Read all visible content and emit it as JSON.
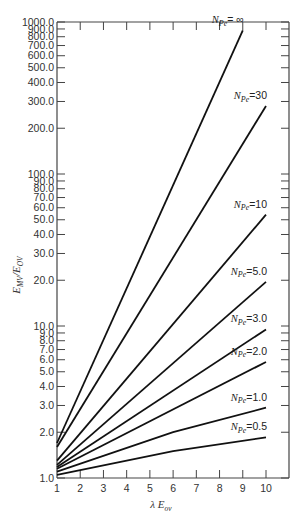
{
  "chart_data": {
    "type": "line",
    "title": "",
    "xlabel": "λ E_ov",
    "ylabel": "E_MV/E_OV",
    "xscale": "linear",
    "yscale": "log",
    "xlim": [
      1,
      11
    ],
    "ylim": [
      1.0,
      1000.0
    ],
    "grid": false,
    "legend_position": "inline labels at right end of each curve",
    "x_ticks": [
      "1",
      "2",
      "3",
      "4",
      "5",
      "6",
      "7",
      "8",
      "9",
      "10"
    ],
    "y_ticks": [
      "1.0",
      "2.0",
      "3.0",
      "4.0",
      "5.0",
      "6.0",
      "7.0",
      "8.0",
      "9.0",
      "10.0",
      "20.0",
      "30.0",
      "40.0",
      "50.0",
      "60.0",
      "70.0",
      "80.0",
      "90.0",
      "100.0",
      "200.0",
      "300.0",
      "400.0",
      "500.0",
      "600.0",
      "700.0",
      "800.0",
      "900.0",
      "1000.0"
    ],
    "y_tick_values": [
      1,
      2,
      3,
      4,
      5,
      6,
      7,
      8,
      9,
      10,
      20,
      30,
      40,
      50,
      60,
      70,
      80,
      90,
      100,
      200,
      300,
      400,
      500,
      600,
      700,
      800,
      900,
      1000
    ],
    "series": [
      {
        "name": "N_Pe = ∞",
        "sub": "Pe",
        "value": "= ∞",
        "x": [
          1,
          9
        ],
        "y": [
          1.7,
          880
        ]
      },
      {
        "name": "N_Pe = 30",
        "sub": "Pe",
        "value": "=30",
        "x": [
          1,
          10
        ],
        "y": [
          1.6,
          280
        ]
      },
      {
        "name": "N_Pe = 10",
        "sub": "Pe",
        "value": "=10",
        "x": [
          1,
          10
        ],
        "y": [
          1.3,
          54
        ]
      },
      {
        "name": "N_Pe = 5.0",
        "sub": "Pe",
        "value": "=5.0",
        "x": [
          1,
          10
        ],
        "y": [
          1.22,
          19.5
        ]
      },
      {
        "name": "N_Pe = 3.0",
        "sub": "Pe",
        "value": "=3.0",
        "x": [
          1,
          10
        ],
        "y": [
          1.18,
          9.5
        ]
      },
      {
        "name": "N_Pe = 2.0",
        "sub": "Pe",
        "value": "=2.0",
        "x": [
          1,
          10
        ],
        "y": [
          1.15,
          5.8
        ]
      },
      {
        "name": "N_Pe = 1.0",
        "sub": "Pe",
        "value": "=1.0",
        "x": [
          1,
          6,
          10
        ],
        "y": [
          1.1,
          2.0,
          2.9
        ]
      },
      {
        "name": "N_Pe = 0.5",
        "sub": "Pe",
        "value": "=0.5",
        "x": [
          1,
          6,
          10
        ],
        "y": [
          1.05,
          1.5,
          1.85
        ]
      }
    ]
  },
  "labels": {
    "y_axis_main": "E",
    "y_axis_sub1": "MV",
    "y_axis_slash": "/E",
    "y_axis_sub2": "OV",
    "x_axis_lambda": "λ E",
    "x_axis_sub": "ov",
    "curve_N": "N"
  }
}
